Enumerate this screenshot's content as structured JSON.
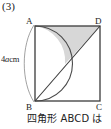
{
  "problem": {
    "number": "(3)",
    "caption": "四角形 ABCD は"
  },
  "figure": {
    "name": "square-with-semicircle-and-diagonal",
    "vertex_labels": {
      "top_left": "A",
      "top_right": "D",
      "bottom_left": "B",
      "bottom_right": "C"
    },
    "dimension_label": {
      "number": "4",
      "variable": "a",
      "unit": "cm",
      "full": "4acm",
      "measures": "AB"
    },
    "colors": {
      "stroke": "#3b3b3b",
      "shaded_fill": "#d7d7d7",
      "shaded_stroke": "#9a9a9a",
      "background": "#ffffff"
    },
    "elements": [
      "square ABCD",
      "semicircle on diameter AB bulging right",
      "diagonal from B to D",
      "shaded region between arc and diagonal near D",
      "measurement brace along AB"
    ]
  }
}
